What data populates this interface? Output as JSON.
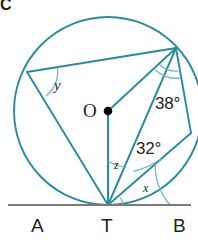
{
  "figure": {
    "panel_letter": "C",
    "type": "circle-geometry-diagram",
    "colors": {
      "stroke_teal": "#2b8a9e",
      "baseline_gray": "#7a7a7a",
      "text_dark": "#231f20",
      "center_dot": "#000000",
      "background": "#ffffff"
    }
  },
  "points": {
    "center_label": "O",
    "tangent_point_label": "T",
    "tangent_left_label": "A",
    "tangent_right_label": "B"
  },
  "angles": {
    "y": "y",
    "z": "z",
    "x": "x",
    "upper_right": "38°",
    "lower_right": "32°"
  },
  "geometry": {
    "circle": {
      "cx": 108,
      "cy": 111,
      "r": 94
    },
    "center_dot": {
      "cx": 108,
      "cy": 111,
      "r": 4.2
    },
    "tangent_line": {
      "x1": 8,
      "y1": 205,
      "x2": 191,
      "y2": 205
    },
    "vertices": {
      "T": {
        "x": 108,
        "y": 205
      },
      "P": {
        "x": 176,
        "y": 48
      },
      "Q": {
        "x": 27,
        "y": 72
      },
      "R": {
        "x": 191,
        "y": 133
      }
    },
    "segments": [
      {
        "name": "chord-QP",
        "x1": 27,
        "y1": 72,
        "x2": 176,
        "y2": 48
      },
      {
        "name": "chord-QT",
        "x1": 27,
        "y1": 72,
        "x2": 108,
        "y2": 205
      },
      {
        "name": "chord-TP",
        "x1": 108,
        "y1": 205,
        "x2": 176,
        "y2": 48
      },
      {
        "name": "chord-TR",
        "x1": 108,
        "y1": 205,
        "x2": 191,
        "y2": 133
      },
      {
        "name": "chord-PR",
        "x1": 176,
        "y1": 48,
        "x2": 191,
        "y2": 133
      },
      {
        "name": "radius-OP",
        "x1": 108,
        "y1": 111,
        "x2": 176,
        "y2": 48
      },
      {
        "name": "radius-OT",
        "x1": 108,
        "y1": 111,
        "x2": 108,
        "y2": 205
      }
    ]
  }
}
